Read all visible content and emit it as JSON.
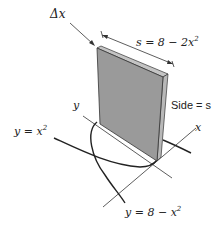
{
  "figure": {
    "labels": {
      "delta_x": "Δx",
      "side_length_formula": "s = 8 − 2x",
      "side_length_exponent": "2",
      "side_label": "Side = s",
      "axis_y": "y",
      "axis_x": "x",
      "curve_lower_prefix": "y = x",
      "curve_lower_exponent": "2",
      "curve_upper_prefix": "y = 8 − x",
      "curve_upper_exponent": "2"
    },
    "colors": {
      "plate_face": "#9a9a9a",
      "plate_edge": "#c4c4c4",
      "stroke": "#222222"
    }
  }
}
